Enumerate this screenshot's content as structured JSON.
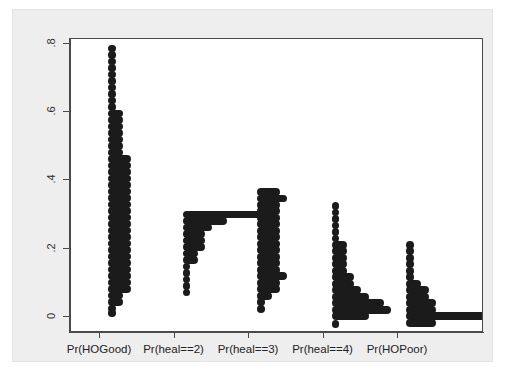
{
  "chart_data": {
    "type": "scatter",
    "title": "",
    "subtitle": "",
    "xlabel": "",
    "ylabel": "",
    "grid": false,
    "legend": "none",
    "ylim": [
      -0.02,
      0.84
    ],
    "y_ticks": [
      "0",
      ".2",
      ".4",
      ".6",
      ".8"
    ],
    "y_tick_values": [
      0,
      0.2,
      0.4,
      0.6,
      0.8
    ],
    "categories": [
      "Pr(HOGood)",
      "Pr(heal==2)",
      "Pr(heal==3)",
      "Pr(heal==4)",
      "Pr(HOPoor)"
    ],
    "series": [
      {
        "name": "Pr(HOGood)",
        "bins": [
          {
            "value": 0.812,
            "count": 1
          },
          {
            "value": 0.793,
            "count": 1
          },
          {
            "value": 0.774,
            "count": 1
          },
          {
            "value": 0.755,
            "count": 1
          },
          {
            "value": 0.736,
            "count": 1
          },
          {
            "value": 0.717,
            "count": 1
          },
          {
            "value": 0.698,
            "count": 1
          },
          {
            "value": 0.679,
            "count": 1
          },
          {
            "value": 0.66,
            "count": 1
          },
          {
            "value": 0.641,
            "count": 1
          },
          {
            "value": 0.622,
            "count": 2
          },
          {
            "value": 0.603,
            "count": 2
          },
          {
            "value": 0.584,
            "count": 2
          },
          {
            "value": 0.565,
            "count": 2
          },
          {
            "value": 0.546,
            "count": 2
          },
          {
            "value": 0.527,
            "count": 2
          },
          {
            "value": 0.508,
            "count": 2
          },
          {
            "value": 0.489,
            "count": 3
          },
          {
            "value": 0.47,
            "count": 3
          },
          {
            "value": 0.451,
            "count": 3
          },
          {
            "value": 0.432,
            "count": 3
          },
          {
            "value": 0.413,
            "count": 3
          },
          {
            "value": 0.394,
            "count": 3
          },
          {
            "value": 0.375,
            "count": 3
          },
          {
            "value": 0.356,
            "count": 3
          },
          {
            "value": 0.337,
            "count": 3
          },
          {
            "value": 0.318,
            "count": 3
          },
          {
            "value": 0.299,
            "count": 3
          },
          {
            "value": 0.28,
            "count": 3
          },
          {
            "value": 0.261,
            "count": 3
          },
          {
            "value": 0.242,
            "count": 3
          },
          {
            "value": 0.223,
            "count": 3
          },
          {
            "value": 0.204,
            "count": 3
          },
          {
            "value": 0.185,
            "count": 3
          },
          {
            "value": 0.166,
            "count": 3
          },
          {
            "value": 0.147,
            "count": 3
          },
          {
            "value": 0.128,
            "count": 3
          },
          {
            "value": 0.109,
            "count": 3
          },
          {
            "value": 0.09,
            "count": 2
          },
          {
            "value": 0.071,
            "count": 2
          },
          {
            "value": 0.052,
            "count": 1
          },
          {
            "value": 0.038,
            "count": 1
          }
        ]
      },
      {
        "name": "Pr(heal==2)",
        "bins": [
          {
            "value": 0.327,
            "count": 12
          },
          {
            "value": 0.308,
            "count": 6
          },
          {
            "value": 0.289,
            "count": 4
          },
          {
            "value": 0.27,
            "count": 3
          },
          {
            "value": 0.251,
            "count": 3
          },
          {
            "value": 0.232,
            "count": 3
          },
          {
            "value": 0.213,
            "count": 2
          },
          {
            "value": 0.194,
            "count": 2
          },
          {
            "value": 0.175,
            "count": 1
          },
          {
            "value": 0.156,
            "count": 1
          },
          {
            "value": 0.137,
            "count": 1
          },
          {
            "value": 0.118,
            "count": 1
          },
          {
            "value": 0.099,
            "count": 1
          }
        ]
      },
      {
        "name": "Pr(heal==3)",
        "bins": [
          {
            "value": 0.393,
            "count": 3
          },
          {
            "value": 0.374,
            "count": 4
          },
          {
            "value": 0.355,
            "count": 3
          },
          {
            "value": 0.336,
            "count": 3
          },
          {
            "value": 0.317,
            "count": 3
          },
          {
            "value": 0.298,
            "count": 3
          },
          {
            "value": 0.279,
            "count": 3
          },
          {
            "value": 0.26,
            "count": 3
          },
          {
            "value": 0.241,
            "count": 3
          },
          {
            "value": 0.222,
            "count": 3
          },
          {
            "value": 0.203,
            "count": 3
          },
          {
            "value": 0.184,
            "count": 3
          },
          {
            "value": 0.165,
            "count": 3
          },
          {
            "value": 0.146,
            "count": 4
          },
          {
            "value": 0.127,
            "count": 3
          },
          {
            "value": 0.108,
            "count": 3
          },
          {
            "value": 0.089,
            "count": 2
          },
          {
            "value": 0.07,
            "count": 1
          },
          {
            "value": 0.051,
            "count": 1
          }
        ]
      },
      {
        "name": "Pr(heal==4)",
        "bins": [
          {
            "value": 0.352,
            "count": 1
          },
          {
            "value": 0.333,
            "count": 1
          },
          {
            "value": 0.314,
            "count": 1
          },
          {
            "value": 0.295,
            "count": 1
          },
          {
            "value": 0.276,
            "count": 1
          },
          {
            "value": 0.257,
            "count": 1
          },
          {
            "value": 0.238,
            "count": 2
          },
          {
            "value": 0.219,
            "count": 2
          },
          {
            "value": 0.2,
            "count": 2
          },
          {
            "value": 0.181,
            "count": 2
          },
          {
            "value": 0.162,
            "count": 2
          },
          {
            "value": 0.143,
            "count": 3
          },
          {
            "value": 0.124,
            "count": 3
          },
          {
            "value": 0.105,
            "count": 4
          },
          {
            "value": 0.086,
            "count": 5
          },
          {
            "value": 0.067,
            "count": 7
          },
          {
            "value": 0.048,
            "count": 8
          },
          {
            "value": 0.029,
            "count": 5
          },
          {
            "value": 0.006,
            "count": 1
          }
        ]
      },
      {
        "name": "Pr(HOPoor)",
        "bins": [
          {
            "value": 0.238,
            "count": 1
          },
          {
            "value": 0.219,
            "count": 1
          },
          {
            "value": 0.2,
            "count": 1
          },
          {
            "value": 0.181,
            "count": 1
          },
          {
            "value": 0.162,
            "count": 1
          },
          {
            "value": 0.143,
            "count": 1
          },
          {
            "value": 0.124,
            "count": 2
          },
          {
            "value": 0.105,
            "count": 3
          },
          {
            "value": 0.086,
            "count": 3
          },
          {
            "value": 0.067,
            "count": 4
          },
          {
            "value": 0.048,
            "count": 4
          },
          {
            "value": 0.029,
            "count": 13
          },
          {
            "value": 0.01,
            "count": 4
          }
        ]
      }
    ],
    "colors": {
      "marker": "#1b1b1b",
      "plot_background": "#ffffff",
      "graph_background": "#eeeeee",
      "axis": "#4a4a4a"
    }
  }
}
